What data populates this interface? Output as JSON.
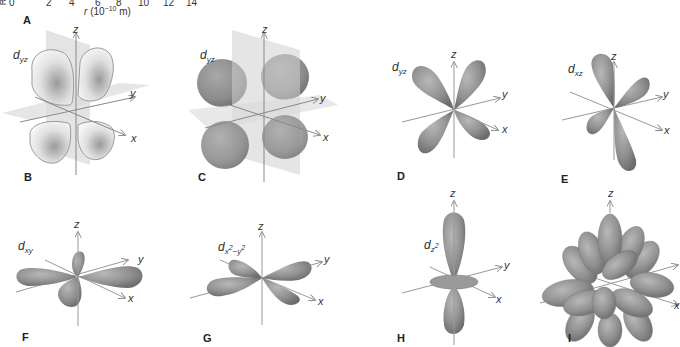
{
  "figure": {
    "top_axis": {
      "stub_label": "R",
      "ticks": [
        "0",
        "2",
        "4",
        "6",
        "8",
        "10",
        "12",
        "14"
      ],
      "title_var": "r",
      "title_unit_prefix": "(10",
      "title_exponent": "−10",
      "title_unit_suffix": " m)"
    },
    "panels": [
      {
        "letter": "A"
      },
      {
        "letter": "B",
        "orbital": "d",
        "subscript": "yz",
        "style": "cross-section with nodal planes"
      },
      {
        "letter": "C",
        "orbital": "d",
        "subscript": "yz",
        "style": "boundary surface with nodal planes"
      },
      {
        "letter": "D",
        "orbital": "d",
        "subscript": "yz",
        "style": "lobe surface"
      },
      {
        "letter": "E",
        "orbital": "d",
        "subscript": "xz",
        "style": "lobe surface"
      },
      {
        "letter": "F",
        "orbital": "d",
        "subscript": "xy",
        "style": "lobe surface"
      },
      {
        "letter": "G",
        "orbital": "d",
        "subscript": "x",
        "sub_sup": "2",
        "subscript2": "−y",
        "sub_sup2": "2",
        "style": "lobe surface"
      },
      {
        "letter": "H",
        "orbital": "d",
        "subscript": "z",
        "sub_sup": "2",
        "style": "lobe surface with torus"
      },
      {
        "letter": "I",
        "style": "superposition of all five d orbitals"
      }
    ],
    "axes": {
      "x": "x",
      "y": "y",
      "z": "z"
    },
    "colors": {
      "lobe_fill": "#8e8e8e",
      "lobe_light": "#b4b4b4",
      "lobe_dark": "#6e6e6e",
      "plane_fill": "#d4d4d4",
      "axis_line": "#8a8a8a",
      "cross_section_fill": "#f4f4f4"
    }
  }
}
